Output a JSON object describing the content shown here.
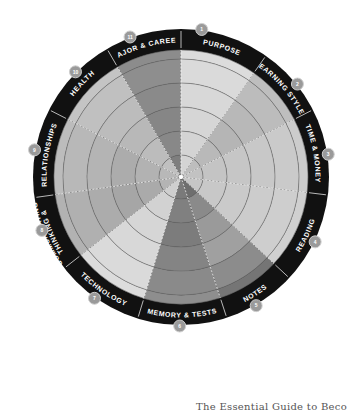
{
  "diagram": {
    "type": "wheel",
    "center": [
      181,
      177
    ],
    "ring_outer_radius": 148,
    "ring_inner_radius": 127,
    "ring_color": "#111111",
    "grid_radii": [
      22,
      46,
      70,
      94,
      118
    ],
    "segments": [
      {
        "number": "1",
        "label": "PURPOSE",
        "start": 0,
        "end": 35,
        "shades": [
          "#d4d4d4",
          "#d4d4d4",
          "#d6d6d6",
          "#d8d8d8",
          "#dadada",
          "#dcdcdc"
        ]
      },
      {
        "number": "2",
        "label": "LEARNING STYLES",
        "start": 35,
        "end": 63,
        "shades": [
          "#bdbdbd",
          "#b9b9b9",
          "#b5b5b5",
          "#b8b8b8",
          "#bcbcbc",
          "#bebebe"
        ]
      },
      {
        "number": "3",
        "label": "TIME & MONEY",
        "start": 63,
        "end": 97,
        "shades": [
          "#c2c2c2",
          "#c4c4c4",
          "#c6c6c6",
          "#c8c8c8",
          "#cacaca",
          "#cccccc"
        ]
      },
      {
        "number": "4",
        "label": "READING",
        "start": 97,
        "end": 133,
        "shades": [
          "#c6c6c6",
          "#c8c8c8",
          "#cacaca",
          "#cccccc",
          "#cecece",
          "#d0d0d0"
        ]
      },
      {
        "number": "5",
        "label": "NOTES",
        "start": 133,
        "end": 162,
        "shades": [
          "#6e6e6e",
          "#8a8a8a",
          "#9a9a9a",
          "#a0a0a0",
          "#8c8c8c",
          "#757575"
        ]
      },
      {
        "number": "6",
        "label": "MEMORY & TESTS",
        "start": 162,
        "end": 197,
        "shades": [
          "#7a7a7a",
          "#808080",
          "#7c7c7c",
          "#848484",
          "#8a8a8a",
          "#8e8e8e"
        ]
      },
      {
        "number": "7",
        "label": "TECHNOLOGY",
        "start": 197,
        "end": 232,
        "shades": [
          "#cfcfcf",
          "#d2d2d2",
          "#d6d6d6",
          "#d8d8d8",
          "#dadada",
          "#dcdcdc"
        ]
      },
      {
        "number": "8",
        "label": "THINKING & COMMUNICATING",
        "start": 232,
        "end": 262,
        "shades": [
          "#b4b4b4",
          "#aaaaaa",
          "#a6a6a6",
          "#acacac",
          "#b0b0b0",
          "#b2b2b2"
        ]
      },
      {
        "number": "9",
        "label": "RELATIONSHIPS",
        "start": 262,
        "end": 297,
        "shades": [
          "#b8b8b8",
          "#b2b2b2",
          "#acacac",
          "#b4b4b4",
          "#b8b8b8",
          "#bcbcbc"
        ]
      },
      {
        "number": "10",
        "label": "HEALTH",
        "start": 297,
        "end": 330,
        "shades": [
          "#c0c0c0",
          "#bcbcbc",
          "#b8b8b8",
          "#bcbcbc",
          "#c0c0c0",
          "#c4c4c4"
        ]
      },
      {
        "number": "11",
        "label": "MAJOR & CAREER",
        "start": 330,
        "end": 360,
        "shades": [
          "#7e7e7e",
          "#888888",
          "#868686",
          "#8a8a8a",
          "#8e8e8e",
          "#8c8c8c"
        ]
      }
    ],
    "badge_color": "#9a9a9a"
  },
  "footer": {
    "text": "The Essential Guide to Beco"
  }
}
